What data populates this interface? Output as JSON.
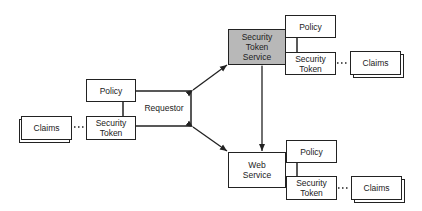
{
  "diagram": {
    "requestor": {
      "label": "Requestor",
      "policy": "Policy",
      "security_token_line1": "Security",
      "security_token_line2": "Token",
      "claims": "Claims"
    },
    "sts": {
      "label_line1": "Security",
      "label_line2": "Token",
      "label_line3": "Service",
      "fill_color": "#b8b8b8",
      "policy": "Policy",
      "security_token_line1": "Security",
      "security_token_line2": "Token",
      "claims": "Claims"
    },
    "web_service": {
      "label_line1": "Web",
      "label_line2": "Service",
      "policy": "Policy",
      "security_token_line1": "Security",
      "security_token_line2": "Token",
      "claims": "Claims"
    },
    "edges": [
      {
        "from": "requestor",
        "to": "sts",
        "type": "bidirectional-arrow"
      },
      {
        "from": "requestor",
        "to": "web_service",
        "type": "bidirectional-arrow"
      },
      {
        "from": "web_service",
        "to": "sts",
        "type": "arrow"
      },
      {
        "from": "security_token",
        "to": "claims",
        "type": "dotted"
      }
    ]
  }
}
